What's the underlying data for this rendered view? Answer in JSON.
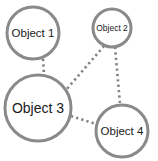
{
  "diagram": {
    "type": "network-graph",
    "nodes": [
      {
        "id": "object-1",
        "label": "Object 1",
        "cx": 33,
        "cy": 33,
        "r": 26,
        "font_size": 11.5
      },
      {
        "id": "object-2",
        "label": "Object 2",
        "cx": 112,
        "cy": 28,
        "r": 19,
        "font_size": 8.5
      },
      {
        "id": "object-3",
        "label": "Object 3",
        "cx": 38,
        "cy": 108,
        "r": 33,
        "font_size": 14
      },
      {
        "id": "object-4",
        "label": "Object 4",
        "cx": 122,
        "cy": 131,
        "r": 26,
        "font_size": 11.5
      }
    ],
    "edges": [
      {
        "from": "Object 1",
        "to": "Object 3",
        "style": "dotted",
        "x1": 43,
        "y1": 59,
        "x2": 44,
        "y2": 74
      },
      {
        "from": "Object 2",
        "to": "Object 3",
        "style": "dotted",
        "x1": 104,
        "y1": 46,
        "x2": 66,
        "y2": 90
      },
      {
        "from": "Object 2",
        "to": "Object 4",
        "style": "dotted",
        "x1": 115,
        "y1": 47,
        "x2": 120,
        "y2": 104
      },
      {
        "from": "Object 3",
        "to": "Object 4",
        "style": "dotted",
        "x1": 71,
        "y1": 116,
        "x2": 96,
        "y2": 124
      }
    ],
    "colors": {
      "stroke": "#8a8a8a",
      "edge": "#7f7f7f",
      "text": "#1a1a1a",
      "background": "#ffffff"
    }
  }
}
